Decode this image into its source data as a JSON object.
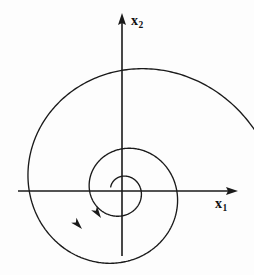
{
  "figure": {
    "type": "phase-portrait",
    "title": "",
    "background_color": "#fdfdfd",
    "ink_color": "#1a1a1a",
    "width": 254,
    "height": 275
  },
  "axes": {
    "origin": {
      "x": 122,
      "y": 191
    },
    "horizontal": {
      "label_base": "x",
      "label_subscript": "1",
      "from_x": 18,
      "to_x": 238,
      "y": 191,
      "arrow_at": "right"
    },
    "vertical": {
      "label_base": "x",
      "label_subscript": "2",
      "from_y": 256,
      "to_y": 13,
      "x": 122,
      "arrow_at": "top"
    }
  },
  "chart_data": {
    "type": "line",
    "title": "",
    "xlabel": "x1",
    "ylabel": "x2",
    "series": [
      {
        "name": "spiral-trajectory",
        "spiral": {
          "kind": "logarithmic",
          "center": [
            122,
            191
          ],
          "direction": "clockwise-inward",
          "theta_start_deg": 20,
          "theta_end_deg": 880,
          "r_start": 148,
          "r_end": 12,
          "decay_per_turn": 0.38
        }
      }
    ],
    "flow_arrows": [
      {
        "name": "outer-flow-arrow",
        "x": 82,
        "y": 229,
        "angle_deg": 47
      },
      {
        "name": "inner-flow-arrow",
        "x": 101,
        "y": 218,
        "angle_deg": 55
      }
    ],
    "grid": false,
    "legend": false
  },
  "labels": {
    "x_axis": {
      "base": "x",
      "sub": "1"
    },
    "y_axis": {
      "base": "x",
      "sub": "2"
    }
  }
}
